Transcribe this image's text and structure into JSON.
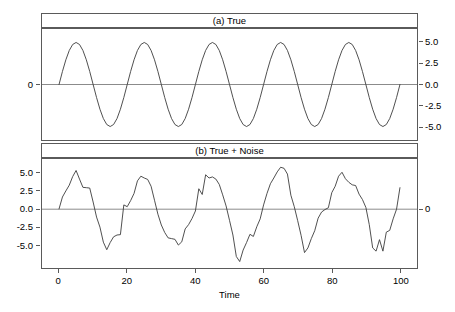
{
  "figure": {
    "width": 455,
    "height": 312,
    "background": "#ffffff",
    "line_color": "#3a3a3a",
    "frame_color": "#5a5a5a",
    "text_color": "#000000"
  },
  "axis": {
    "xlabel": "Time",
    "xticks": [
      0,
      20,
      40,
      60,
      80,
      100
    ],
    "xtick_labels": [
      "0",
      "20",
      "40",
      "60",
      "80",
      "100"
    ],
    "xlim": [
      -5,
      105
    ],
    "panel_a": {
      "ylim": [
        -6.6,
        6.6
      ],
      "right_ticks": [
        5.0,
        2.5,
        0.0,
        -2.5,
        -5.0
      ],
      "right_tick_labels": [
        "5.0",
        "2.5",
        "0.0",
        "-2.5",
        "-5.0"
      ],
      "left_tick_labels": [
        "0"
      ],
      "left_ticks": [
        0.0
      ]
    },
    "panel_b": {
      "ylim": [
        -8.2,
        7.0
      ],
      "left_ticks": [
        5.0,
        2.5,
        0.0,
        -2.5,
        -5.0
      ],
      "left_tick_labels": [
        "5.0",
        "2.5",
        "0.0",
        "-2.5",
        "-5.0"
      ],
      "right_tick_labels": [
        "0"
      ],
      "right_ticks": [
        0.0
      ]
    }
  },
  "chart_data": {
    "type": "line",
    "title": "",
    "xlabel": "Time",
    "ylabel": "",
    "grid": false,
    "legend": null,
    "panels": [
      {
        "strip_label": "(a) True",
        "name": "true",
        "ylim": [
          -6.6,
          6.6
        ],
        "ytick_side": "right",
        "ytick_values": [
          5.0,
          2.5,
          0.0,
          -2.5,
          -5.0
        ],
        "ytick_labels": [
          "5.0",
          "2.5",
          "0.0",
          "-2.5",
          "-5.0"
        ],
        "opposite_axis_labels": [
          "0"
        ],
        "description": "Pure sinusoid, amplitude 5, period 20, phase 0 (sine), t = 0..100",
        "series": {
          "name": "True",
          "formula": "y = 5*sin(2*pi*t/20)",
          "amplitude": 5.0,
          "period": 20,
          "phase": 0.0,
          "x": [
            0,
            1,
            2,
            3,
            4,
            5,
            6,
            7,
            8,
            9,
            10,
            11,
            12,
            13,
            14,
            15,
            16,
            17,
            18,
            19,
            20,
            21,
            22,
            23,
            24,
            25,
            26,
            27,
            28,
            29,
            30,
            31,
            32,
            33,
            34,
            35,
            36,
            37,
            38,
            39,
            40,
            41,
            42,
            43,
            44,
            45,
            46,
            47,
            48,
            49,
            50,
            51,
            52,
            53,
            54,
            55,
            56,
            57,
            58,
            59,
            60,
            61,
            62,
            63,
            64,
            65,
            66,
            67,
            68,
            69,
            70,
            71,
            72,
            73,
            74,
            75,
            76,
            77,
            78,
            79,
            80,
            81,
            82,
            83,
            84,
            85,
            86,
            87,
            88,
            89,
            90,
            91,
            92,
            93,
            94,
            95,
            96,
            97,
            98,
            99,
            100
          ],
          "y": [
            0.0,
            1.55,
            2.94,
            4.05,
            4.76,
            5.0,
            4.76,
            4.05,
            2.94,
            1.55,
            0.0,
            -1.55,
            -2.94,
            -4.05,
            -4.76,
            -5.0,
            -4.76,
            -4.05,
            -2.94,
            -1.55,
            0.0,
            1.55,
            2.94,
            4.05,
            4.76,
            5.0,
            4.76,
            4.05,
            2.94,
            1.55,
            0.0,
            -1.55,
            -2.94,
            -4.05,
            -4.76,
            -5.0,
            -4.76,
            -4.05,
            -2.94,
            -1.55,
            0.0,
            1.55,
            2.94,
            4.05,
            4.76,
            5.0,
            4.76,
            4.05,
            2.94,
            1.55,
            0.0,
            -1.55,
            -2.94,
            -4.05,
            -4.76,
            -5.0,
            -4.76,
            -4.05,
            -2.94,
            -1.55,
            0.0,
            1.55,
            2.94,
            4.05,
            4.76,
            5.0,
            4.76,
            4.05,
            2.94,
            1.55,
            0.0,
            -1.55,
            -2.94,
            -4.05,
            -4.76,
            -5.0,
            -4.76,
            -4.05,
            -2.94,
            -1.55,
            0.0,
            1.55,
            2.94,
            4.05,
            4.76,
            5.0,
            4.76,
            4.05,
            2.94,
            1.55,
            0.0,
            -1.55,
            -2.94,
            -4.05,
            -4.76,
            -5.0,
            -4.76,
            -4.05,
            -2.94,
            -1.55,
            0.0
          ]
        }
      },
      {
        "strip_label": "(b) True + Noise",
        "name": "true-plus-noise",
        "ylim": [
          -8.2,
          7.0
        ],
        "ytick_side": "left",
        "ytick_values": [
          5.0,
          2.5,
          0.0,
          -2.5,
          -5.0
        ],
        "ytick_labels": [
          "5.0",
          "2.5",
          "0.0",
          "-2.5",
          "-5.0"
        ],
        "opposite_axis_labels": [
          "0"
        ],
        "description": "Same sinusoid with additive random noise, t = 0..100",
        "series": {
          "name": "True + Noise",
          "x": [
            0,
            1,
            2,
            3,
            4,
            5,
            6,
            7,
            8,
            9,
            10,
            11,
            12,
            13,
            14,
            15,
            16,
            17,
            18,
            19,
            20,
            21,
            22,
            23,
            24,
            25,
            26,
            27,
            28,
            29,
            30,
            31,
            32,
            33,
            34,
            35,
            36,
            37,
            38,
            39,
            40,
            41,
            42,
            43,
            44,
            45,
            46,
            47,
            48,
            49,
            50,
            51,
            52,
            53,
            54,
            55,
            56,
            57,
            58,
            59,
            60,
            61,
            62,
            63,
            64,
            65,
            66,
            67,
            68,
            69,
            70,
            71,
            72,
            73,
            74,
            75,
            76,
            77,
            78,
            79,
            80,
            81,
            82,
            83,
            84,
            85,
            86,
            87,
            88,
            89,
            90,
            91,
            92,
            93,
            94,
            95,
            96,
            97,
            98,
            99,
            100
          ],
          "y": [
            0.05,
            1.7,
            2.55,
            3.35,
            4.55,
            5.4,
            4.2,
            3.05,
            3.0,
            2.95,
            1.0,
            -1.1,
            -2.5,
            -4.6,
            -5.65,
            -4.65,
            -3.85,
            -3.6,
            -3.55,
            0.6,
            0.35,
            1.2,
            2.2,
            3.95,
            4.6,
            4.35,
            4.15,
            3.2,
            1.25,
            -0.7,
            -2.2,
            -3.25,
            -4.0,
            -4.1,
            -4.2,
            -5.0,
            -4.55,
            -2.75,
            -2.15,
            -1.3,
            -0.25,
            2.85,
            2.05,
            4.8,
            4.35,
            4.5,
            4.2,
            3.45,
            2.0,
            0.45,
            -1.55,
            -3.6,
            -6.6,
            -7.3,
            -5.7,
            -4.65,
            -3.5,
            -3.8,
            -2.45,
            -1.35,
            0.6,
            2.2,
            3.55,
            4.35,
            5.2,
            5.85,
            5.7,
            4.9,
            1.95,
            0.35,
            -1.6,
            -3.65,
            -6.05,
            -5.4,
            -4.1,
            -3.0,
            -1.25,
            -0.4,
            -0.05,
            0.2,
            2.3,
            3.2,
            4.6,
            5.15,
            4.25,
            3.75,
            3.4,
            3.3,
            2.1,
            1.35,
            0.25,
            -2.15,
            -5.4,
            -5.85,
            -4.25,
            -5.85,
            -3.2,
            -2.95,
            -1.35,
            0.0,
            3.0
          ]
        }
      }
    ]
  }
}
